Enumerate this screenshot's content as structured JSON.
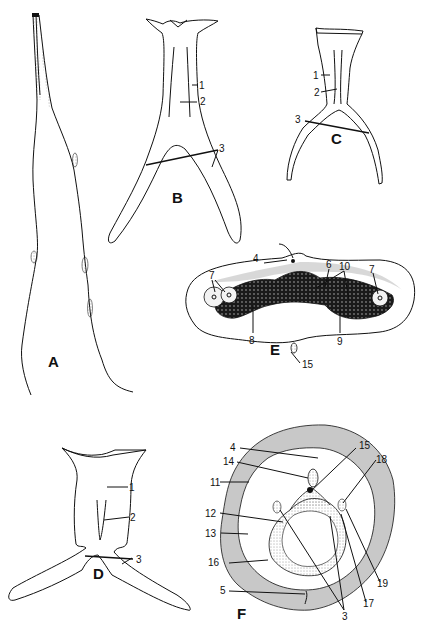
{
  "figure": {
    "panels": [
      {
        "id": "A",
        "label": "A",
        "callouts": []
      },
      {
        "id": "B",
        "label": "B",
        "callouts": [
          "1",
          "2",
          "3"
        ]
      },
      {
        "id": "C",
        "label": "C",
        "callouts": [
          "1",
          "2",
          "3"
        ]
      },
      {
        "id": "D",
        "label": "D",
        "callouts": [
          "1",
          "2",
          "3"
        ]
      },
      {
        "id": "E",
        "label": "E",
        "callouts": [
          "4",
          "6",
          "10",
          "7",
          "7",
          "8",
          "15",
          "9"
        ]
      },
      {
        "id": "F",
        "label": "F",
        "callouts": [
          "4",
          "15",
          "14",
          "18",
          "11",
          "12",
          "13",
          "16",
          "5",
          "3",
          "17",
          "19"
        ]
      }
    ],
    "labels": {
      "B": {
        "n1": "1",
        "n2": "2",
        "n3": "3"
      },
      "C": {
        "n1": "1",
        "n2": "2",
        "n3": "3"
      },
      "D": {
        "n1": "1",
        "n2": "2",
        "n3": "3"
      },
      "E": {
        "n4": "4",
        "n6": "6",
        "n10": "10",
        "n7a": "7",
        "n7b": "7",
        "n8": "8",
        "n15": "15",
        "n9": "9"
      },
      "F": {
        "n4": "4",
        "n15": "15",
        "n14": "14",
        "n18": "18",
        "n11": "11",
        "n12": "12",
        "n13": "13",
        "n16": "16",
        "n5": "5",
        "n3": "3",
        "n17": "17",
        "n19": "19"
      }
    }
  }
}
